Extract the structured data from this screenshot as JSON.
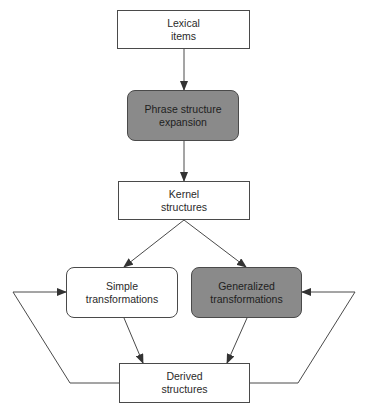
{
  "diagram": {
    "nodes": [
      {
        "id": "lexical",
        "line1": "Lexical",
        "line2": "items",
        "shape": "rectangle",
        "fill": "#ffffff"
      },
      {
        "id": "phrase",
        "line1": "Phrase structure",
        "line2": "expansion",
        "shape": "rounded",
        "fill": "#8a8a8a"
      },
      {
        "id": "kernel",
        "line1": "Kernel",
        "line2": "structures",
        "shape": "rectangle",
        "fill": "#ffffff"
      },
      {
        "id": "simple",
        "line1": "Simple",
        "line2": "transformations",
        "shape": "rounded",
        "fill": "#ffffff"
      },
      {
        "id": "generalized",
        "line1": "Generalized",
        "line2": "transformations",
        "shape": "rounded",
        "fill": "#8a8a8a"
      },
      {
        "id": "derived",
        "line1": "Derived",
        "line2": "structures",
        "shape": "rectangle",
        "fill": "#ffffff"
      }
    ],
    "edges": [
      {
        "from": "lexical",
        "to": "phrase"
      },
      {
        "from": "phrase",
        "to": "kernel"
      },
      {
        "from": "kernel",
        "to": "simple"
      },
      {
        "from": "kernel",
        "to": "generalized"
      },
      {
        "from": "simple",
        "to": "derived"
      },
      {
        "from": "generalized",
        "to": "derived"
      },
      {
        "from": "derived",
        "to": "simple",
        "type": "feedback-left"
      },
      {
        "from": "derived",
        "to": "generalized",
        "type": "feedback-right"
      }
    ],
    "colors": {
      "line": "#4a4a4a",
      "shaded_fill": "#8a8a8a",
      "text": "#2a2a2a"
    }
  }
}
